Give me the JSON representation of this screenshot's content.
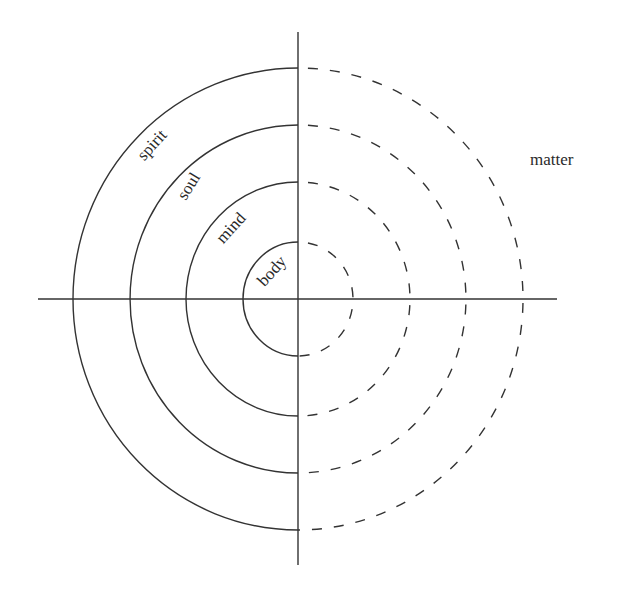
{
  "diagram": {
    "type": "concentric-layers",
    "center": {
      "x": 298,
      "y": 299
    },
    "colors": {
      "stroke": "#333333",
      "text": "#2a2a2a",
      "background": "#ffffff"
    },
    "axes": {
      "horizontal": {
        "x1": 38,
        "x2": 557,
        "y": 299
      },
      "vertical": {
        "x": 298,
        "y1": 32,
        "y2": 565
      }
    },
    "rings": [
      {
        "label": "body",
        "rx": 55,
        "ry": 57,
        "label_pos": {
          "x": 273,
          "y": 272,
          "rotate": -48
        }
      },
      {
        "label": "mind",
        "rx": 112,
        "ry": 117,
        "label_pos": {
          "x": 232,
          "y": 229,
          "rotate": -48
        }
      },
      {
        "label": "soul",
        "rx": 168,
        "ry": 174,
        "label_pos": {
          "x": 190,
          "y": 187,
          "rotate": -58
        }
      },
      {
        "label": "spirit",
        "rx": 225,
        "ry": 231,
        "label_pos": {
          "x": 153,
          "y": 146,
          "rotate": -48
        }
      }
    ],
    "left_half_style": "solid",
    "right_half_style": "dashed",
    "outer_label": {
      "text": "matter",
      "x": 530,
      "y": 165
    }
  }
}
